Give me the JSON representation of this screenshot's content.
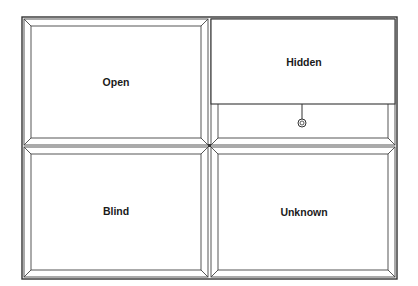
{
  "diagram": {
    "type": "johari-window",
    "frame_color": "#333333",
    "background": "#ffffff",
    "panes": [
      {
        "id": "open",
        "label": "Open",
        "position": "top-left"
      },
      {
        "id": "hidden",
        "label": "Hidden",
        "position": "top-right",
        "shade": true,
        "shade_pull": "ring"
      },
      {
        "id": "blind",
        "label": "Blind",
        "position": "bottom-left"
      },
      {
        "id": "unknown",
        "label": "Unknown",
        "position": "bottom-right"
      }
    ]
  }
}
